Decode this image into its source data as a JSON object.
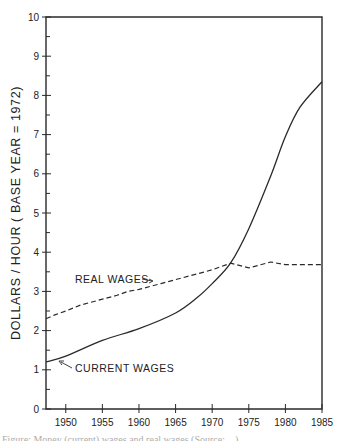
{
  "chart_data": {
    "type": "line",
    "title": "",
    "xlabel": "",
    "ylabel": "DOLLARS / HOUR ( BASE YEAR = 1972)",
    "xlim": [
      1947.3,
      1985
    ],
    "ylim": [
      0,
      10
    ],
    "grid": false,
    "legend": "none (inline annotations)",
    "x_ticks": [
      1950,
      1955,
      1960,
      1965,
      1970,
      1975,
      1980,
      1985
    ],
    "y_ticks": [
      0,
      1,
      2,
      3,
      4,
      5,
      6,
      7,
      8,
      9,
      10
    ],
    "y_minor_step": 0.5,
    "series": [
      {
        "name": "Current wages",
        "style": "solid",
        "x": [
          1947.3,
          1950,
          1955,
          1960,
          1965,
          1968,
          1970,
          1972.5,
          1975,
          1978,
          1980,
          1982,
          1985
        ],
        "values": [
          1.2,
          1.35,
          1.75,
          2.05,
          2.45,
          2.85,
          3.2,
          3.72,
          4.6,
          5.95,
          6.95,
          7.7,
          8.35
        ]
      },
      {
        "name": "Real wages",
        "style": "dashed",
        "x": [
          1947.3,
          1948.5,
          1950,
          1952,
          1955,
          1957,
          1958.5,
          1960,
          1963,
          1965,
          1968,
          1970,
          1972.5,
          1975,
          1978,
          1980,
          1982,
          1985
        ],
        "values": [
          2.3,
          2.4,
          2.5,
          2.65,
          2.8,
          2.9,
          3.0,
          3.05,
          3.2,
          3.3,
          3.45,
          3.55,
          3.72,
          3.6,
          3.75,
          3.68,
          3.68,
          3.68
        ]
      }
    ],
    "annotations": [
      {
        "text": "REAL WAGES",
        "points_to": "Real wages",
        "x": 1953.5,
        "y": 3.35
      },
      {
        "text": "CURRENT WAGES",
        "points_to": "Current wages",
        "x": 1950,
        "y": 0.9
      }
    ]
  },
  "labels": {
    "ylabel": "DOLLARS / HOUR ( BASE YEAR = 1972)",
    "real_wages": "REAL WAGES",
    "current_wages": "CURRENT WAGES"
  },
  "caption": "Figure: Money (current) wages and real wages (Source: ...)"
}
